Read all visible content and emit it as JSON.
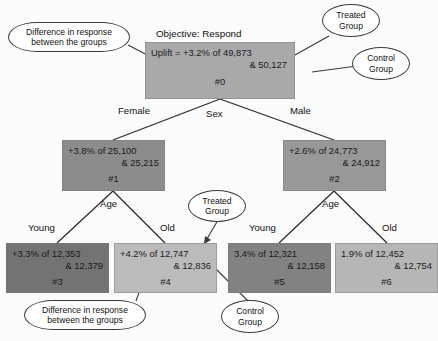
{
  "diagram": {
    "title_text": "Objective: Respond",
    "type": "uplift-decision-tree"
  },
  "nodes": {
    "root": {
      "id_label": "#0",
      "line1": "Uplift = +3.2% of 49,873",
      "line2": "& 50,127",
      "uplift_pct": "+3.2%",
      "treated_n": "49,873",
      "control_n": "50,127",
      "fill": "#a9a9a9"
    },
    "n1": {
      "id_label": "#1",
      "line1": "+3.8% of 25,100",
      "line2": "& 25,215",
      "uplift_pct": "+3.8%",
      "treated_n": "25,100",
      "control_n": "25,215",
      "fill": "#8c8c8c"
    },
    "n2": {
      "id_label": "#2",
      "line1": "+2.6% of 24,773",
      "line2": "& 24,912",
      "uplift_pct": "+2.6%",
      "treated_n": "24,773",
      "control_n": "24,912",
      "fill": "#989898"
    },
    "n3": {
      "id_label": "#3",
      "line1": "+3.3% of 12,353",
      "line2": "& 12,379",
      "uplift_pct": "+3.3%",
      "treated_n": "12,353",
      "control_n": "12,379",
      "fill": "#737373"
    },
    "n4": {
      "id_label": "#4",
      "line1": "+4.2% of 12,747",
      "line2": "& 12,836",
      "uplift_pct": "+4.2%",
      "treated_n": "12,747",
      "control_n": "12,836",
      "fill": "#bbbbbb"
    },
    "n5": {
      "id_label": "#5",
      "line1": "3.4% of 12,321",
      "line2": "& 12,158",
      "uplift_pct": "3.4%",
      "treated_n": "12,321",
      "control_n": "12,158",
      "fill": "#828282"
    },
    "n6": {
      "id_label": "#6",
      "line1": "1.9% of 12,452",
      "line2": "& 12,754",
      "uplift_pct": "1.9%",
      "treated_n": "12,452",
      "control_n": "12,754",
      "fill": "#b6b6b6"
    }
  },
  "splits": {
    "root_split": "Sex",
    "root_left": "Female",
    "root_right": "Male",
    "left_split": "Age",
    "left_left": "Young",
    "left_right": "Old",
    "right_split": "Age",
    "right_left": "Young",
    "right_right": "Old"
  },
  "callouts": {
    "diff_top_line1": "Difference in response",
    "diff_top_line2": "between the groups",
    "treated_top_line1": "Treated",
    "treated_top_line2": "Group",
    "control_top_line1": "Control",
    "control_top_line2": "Group",
    "treated_mid_line1": "Treated",
    "treated_mid_line2": "Group",
    "diff_bottom_line1": "Difference in response",
    "diff_bottom_line2": "between the groups",
    "control_bottom_line1": "Control",
    "control_bottom_line2": "Group"
  },
  "colors": {
    "edge_stroke": "#2b2b2b",
    "callout_stroke": "#3a3a3a",
    "text": "#111111",
    "background": "#fbfbfb"
  }
}
